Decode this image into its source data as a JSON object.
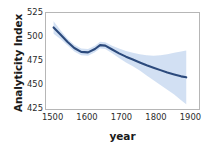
{
  "chart_data": {
    "type": "line",
    "title": "",
    "xlabel": "year",
    "ylabel": "Analyticity Index",
    "xlim": [
      1478,
      1922
    ],
    "ylim": [
      425,
      525
    ],
    "xticks": [
      1500,
      1600,
      1700,
      1800,
      1900
    ],
    "xticklabels": [
      "1500",
      "1600",
      "1700",
      "1800",
      "1900"
    ],
    "yticks": [
      425,
      450,
      475,
      500,
      525
    ],
    "yticklabels": [
      "425",
      "450",
      "475",
      "500",
      "525"
    ],
    "grid": false,
    "legend": "none",
    "line_color": "#2c4a7c",
    "band_color": "#c3d5ef",
    "axis_color": "#b6b6b6",
    "background": "#ffffff",
    "series": [
      {
        "name": "Analyticity Index (smoothed fit)",
        "x": [
          1500,
          1520,
          1540,
          1560,
          1580,
          1600,
          1620,
          1635,
          1650,
          1670,
          1690,
          1710,
          1730,
          1750,
          1770,
          1790,
          1810,
          1830,
          1850,
          1870,
          1885
        ],
        "values": [
          510.0,
          502.5,
          495.0,
          488.5,
          484.5,
          484.0,
          487.5,
          491.5,
          491.0,
          487.0,
          483.0,
          479.5,
          476.5,
          473.5,
          470.5,
          468.0,
          465.5,
          463.0,
          461.0,
          459.0,
          458.0
        ]
      }
    ],
    "confidence_band": {
      "name": "95% confidence interval",
      "x": [
        1500,
        1520,
        1540,
        1560,
        1580,
        1600,
        1620,
        1635,
        1650,
        1670,
        1690,
        1710,
        1730,
        1750,
        1770,
        1790,
        1810,
        1830,
        1850,
        1870,
        1885
      ],
      "upper": [
        516.5,
        507.0,
        498.5,
        492.0,
        488.0,
        487.5,
        491.0,
        495.0,
        494.5,
        491.0,
        488.0,
        485.5,
        483.5,
        482.0,
        481.0,
        480.5,
        481.0,
        482.0,
        483.5,
        485.0,
        486.0
      ],
      "lower": [
        503.5,
        498.0,
        491.5,
        485.0,
        481.0,
        480.5,
        484.0,
        488.0,
        487.5,
        483.0,
        478.0,
        473.5,
        469.5,
        465.0,
        460.0,
        455.0,
        450.0,
        445.0,
        440.0,
        434.0,
        430.0
      ]
    }
  },
  "axes": {
    "y_title": "Analyticity Index",
    "x_title": "year"
  }
}
